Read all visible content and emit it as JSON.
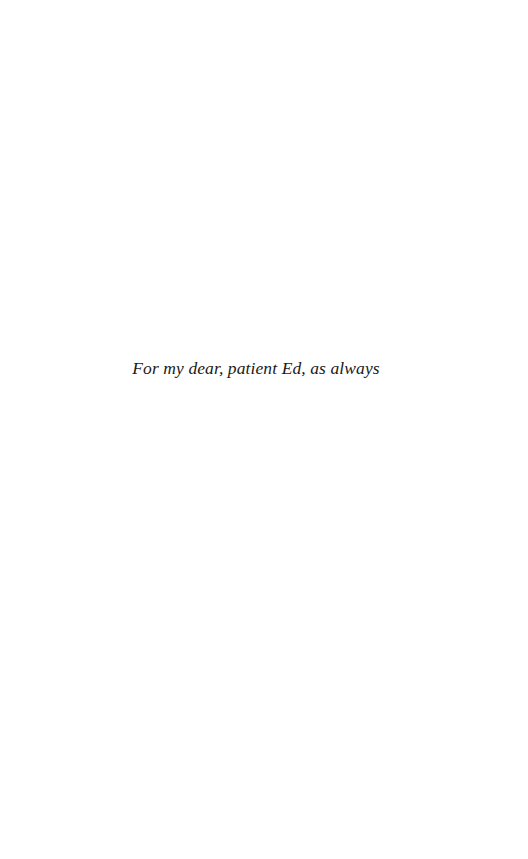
{
  "page": {
    "type": "dedication-page",
    "dedication": "For my dear, patient Ed, as always"
  }
}
